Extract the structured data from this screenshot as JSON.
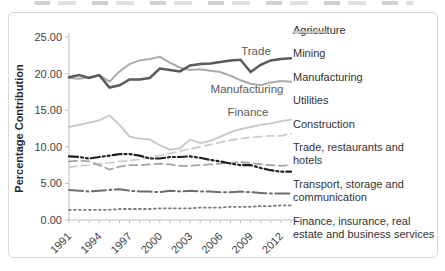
{
  "page": {
    "background": "#ffffff",
    "frame_border_color": "#d8d8d8"
  },
  "chart_data": {
    "type": "line",
    "title": "",
    "ylabel": "Percentage Contribution",
    "xlabel": "",
    "ylim": [
      0,
      25
    ],
    "y_ticks": [
      "0.00",
      "5.00",
      "10.00",
      "15.00",
      "20.00",
      "25.00"
    ],
    "x_start": 1991,
    "x_end": 2013,
    "x_tick_labels": [
      "1991",
      "1994",
      "1997",
      "2000",
      "2003",
      "2006",
      "2009",
      "2012"
    ],
    "grid": false,
    "legend_position": "right",
    "axis_color": "#bfbfbf",
    "tick_label_color": "#3f3f3f",
    "annotations": [
      {
        "text": "Trade"
      },
      {
        "text": "Manufacturing"
      },
      {
        "text": "Finance"
      }
    ],
    "series": [
      {
        "name": "agriculture",
        "label": "Agriculture",
        "color": "#6e6e6e",
        "line_style": "dash-dot",
        "line_width": 2,
        "values": [
          4.1,
          4.0,
          3.9,
          4.0,
          4.1,
          4.2,
          4.0,
          3.9,
          3.9,
          3.8,
          4.0,
          3.9,
          4.0,
          3.9,
          3.9,
          3.8,
          3.8,
          3.9,
          3.8,
          3.7,
          3.6,
          3.6,
          3.6
        ]
      },
      {
        "name": "mining",
        "label": "Mining",
        "color": "#1f1f1f",
        "line_style": "dash-dot-dot",
        "line_width": 2.2,
        "values": [
          8.7,
          8.6,
          8.4,
          8.6,
          8.8,
          9.0,
          9.0,
          8.8,
          8.4,
          8.4,
          8.6,
          8.6,
          8.7,
          8.5,
          8.2,
          8.0,
          7.7,
          7.5,
          7.5,
          7.1,
          6.8,
          6.6,
          6.6
        ]
      },
      {
        "name": "manufacturing",
        "label": "Manufacturing",
        "color": "#ababab",
        "line_style": "solid",
        "line_width": 2,
        "values": [
          19.4,
          19.3,
          19.5,
          19.8,
          18.9,
          20.3,
          21.3,
          21.8,
          22.0,
          22.3,
          21.5,
          20.8,
          20.5,
          20.6,
          20.4,
          20.2,
          19.7,
          19.1,
          18.6,
          18.4,
          18.8,
          19.0,
          18.9
        ]
      },
      {
        "name": "utilities",
        "label": "Utilities",
        "color": "#7a7a7a",
        "line_style": "dot",
        "line_width": 1.8,
        "values": [
          1.4,
          1.4,
          1.4,
          1.4,
          1.4,
          1.5,
          1.5,
          1.5,
          1.5,
          1.6,
          1.6,
          1.6,
          1.6,
          1.7,
          1.7,
          1.7,
          1.8,
          1.8,
          1.8,
          1.9,
          1.9,
          2.0,
          2.0
        ]
      },
      {
        "name": "construction",
        "label": "Construction",
        "color": "#a3a3a3",
        "line_style": "dash",
        "line_width": 1.8,
        "values": [
          8.0,
          8.1,
          8.0,
          7.5,
          6.9,
          7.3,
          7.5,
          7.5,
          7.6,
          7.7,
          7.6,
          7.4,
          7.4,
          7.5,
          7.6,
          7.7,
          7.8,
          7.9,
          7.8,
          7.6,
          7.5,
          7.4,
          7.5
        ]
      },
      {
        "name": "trade-restaurants-hotels",
        "label": "Trade, restaurants and hotels",
        "color": "#5a5a5a",
        "line_style": "solid",
        "line_width": 2.5,
        "values": [
          19.5,
          19.8,
          19.4,
          19.8,
          18.1,
          18.4,
          19.2,
          19.2,
          19.4,
          20.7,
          20.5,
          20.3,
          21.1,
          21.3,
          21.4,
          21.6,
          21.8,
          21.9,
          20.2,
          21.2,
          21.8,
          22.0,
          22.1
        ]
      },
      {
        "name": "transport-storage-communication",
        "label": "Transport, storage and communication",
        "color": "#cdcdcd",
        "line_style": "dash",
        "line_width": 1.8,
        "values": [
          7.2,
          7.4,
          7.5,
          7.7,
          7.8,
          8.0,
          8.1,
          8.3,
          8.5,
          8.8,
          9.1,
          9.4,
          9.7,
          10.0,
          10.3,
          10.6,
          10.9,
          11.1,
          11.3,
          11.4,
          11.5,
          11.5,
          11.8
        ]
      },
      {
        "name": "finance-insurance-real-estate",
        "label": "Finance, insurance, real estate and business services",
        "color": "#c7c7c7",
        "line_style": "solid",
        "line_width": 1.8,
        "values": [
          12.7,
          13.0,
          13.3,
          13.6,
          14.3,
          13.0,
          11.4,
          11.1,
          11.0,
          10.2,
          9.6,
          9.8,
          11.0,
          10.5,
          10.8,
          11.4,
          12.0,
          12.4,
          12.7,
          13.0,
          13.2,
          13.5,
          13.7
        ]
      }
    ]
  }
}
